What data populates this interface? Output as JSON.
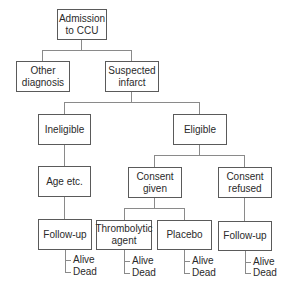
{
  "diagram": {
    "type": "flowchart",
    "nodes": {
      "admission": {
        "line1": "Admission",
        "line2": "to CCU"
      },
      "other": {
        "line1": "Other",
        "line2": "diagnosis"
      },
      "suspected": {
        "line1": "Suspected",
        "line2": "infarct"
      },
      "ineligible": {
        "label": "Ineligible"
      },
      "eligible": {
        "label": "Eligible"
      },
      "age": {
        "label": "Age etc."
      },
      "consent_given": {
        "line1": "Consent",
        "line2": "given"
      },
      "consent_refused": {
        "line1": "Consent",
        "line2": "refused"
      },
      "followup_left": {
        "label": "Follow-up"
      },
      "thrombolytic": {
        "line1": "Thrombolytic",
        "line2": "agent"
      },
      "placebo": {
        "label": "Placebo"
      },
      "followup_right": {
        "label": "Follow-up"
      }
    },
    "outcomes": {
      "followup_left": {
        "alive": "Alive",
        "dead": "Dead"
      },
      "thrombolytic": {
        "alive": "Alive",
        "dead": "Dead"
      },
      "placebo": {
        "alive": "Alive",
        "dead": "Dead"
      },
      "followup_right": {
        "alive": "Alive",
        "dead": "Dead"
      }
    },
    "edges": [
      [
        "Admission to CCU",
        "Other diagnosis"
      ],
      [
        "Admission to CCU",
        "Suspected infarct"
      ],
      [
        "Suspected infarct",
        "Ineligible"
      ],
      [
        "Suspected infarct",
        "Eligible"
      ],
      [
        "Ineligible",
        "Age etc."
      ],
      [
        "Age etc.",
        "Follow-up"
      ],
      [
        "Eligible",
        "Consent given"
      ],
      [
        "Eligible",
        "Consent refused"
      ],
      [
        "Consent given",
        "Thrombolytic agent"
      ],
      [
        "Consent given",
        "Placebo"
      ],
      [
        "Consent refused",
        "Follow-up"
      ]
    ],
    "colors": {
      "border": "#5a5a5a",
      "line": "#8a8a8a",
      "text": "#2a2a2a"
    }
  }
}
